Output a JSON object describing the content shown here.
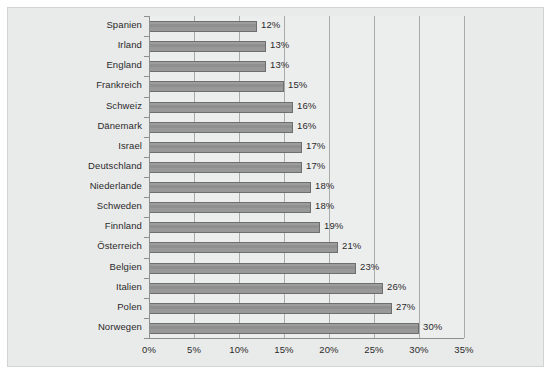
{
  "chart_data": {
    "type": "bar",
    "orientation": "horizontal",
    "title": "",
    "subtitle": "",
    "xlabel": "",
    "ylabel": "",
    "xlim": [
      0,
      35
    ],
    "xtick_labels": [
      "0%",
      "5%",
      "10%",
      "15%",
      "20%",
      "25%",
      "30%",
      "35%"
    ],
    "xticks": [
      0,
      5,
      10,
      15,
      20,
      25,
      30,
      35
    ],
    "grid": true,
    "legend": null,
    "categories": [
      "Spanien",
      "Irland",
      "England",
      "Frankreich",
      "Schweiz",
      "Dänemark",
      "Israel",
      "Deutschland",
      "Niederlande",
      "Schweden",
      "Finnland",
      "Österreich",
      "Belgien",
      "Italien",
      "Polen",
      "Norwegen"
    ],
    "values": [
      12,
      13,
      13,
      15,
      16,
      16,
      17,
      17,
      18,
      18,
      19,
      21,
      23,
      26,
      27,
      30
    ],
    "data_labels": [
      "12%",
      "13%",
      "13%",
      "15%",
      "16%",
      "16%",
      "17%",
      "17%",
      "18%",
      "18%",
      "19%",
      "21%",
      "23%",
      "26%",
      "27%",
      "30%"
    ]
  },
  "colors": {
    "bar_fill": "#949494",
    "bar_edge": "#6e6e6e",
    "plot_background": "#eceded",
    "figure_background": "#e9eaea",
    "gridline": "#a9abab",
    "axis": "#8e9090",
    "text": "#2b2b2b"
  }
}
